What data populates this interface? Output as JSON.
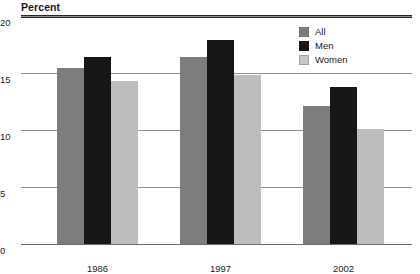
{
  "chart_data": {
    "type": "bar",
    "title": "Percent",
    "xlabel": "",
    "ylabel": "Percent",
    "categories": [
      "1986",
      "1997",
      "2002"
    ],
    "series": [
      {
        "name": "All",
        "color": "#7d7d7d",
        "values": [
          15.4,
          16.4,
          12.1
        ]
      },
      {
        "name": "Men",
        "color": "#171717",
        "values": [
          16.4,
          17.9,
          13.8
        ]
      },
      {
        "name": "Women",
        "color": "#bdbdbd",
        "values": [
          14.3,
          14.8,
          10.1
        ]
      }
    ],
    "ylim": [
      0,
      20
    ],
    "yticks": [
      "0",
      "5",
      "10",
      "15",
      "20"
    ],
    "ytick_values": [
      0,
      5,
      10,
      15,
      20
    ],
    "grid": true,
    "legend_position": "top-right"
  },
  "header": {
    "axis_title": "Percent"
  },
  "legend": {
    "items": [
      {
        "label": "All"
      },
      {
        "label": "Men"
      },
      {
        "label": "Women"
      }
    ]
  },
  "caption": {
    "text": ""
  }
}
